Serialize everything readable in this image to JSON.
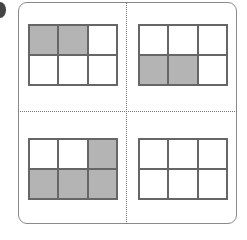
{
  "figure": {
    "shade_color": "#b4b4b4",
    "line_color": "#666666",
    "panels": [
      {
        "name": "top-left",
        "rows": 2,
        "cols": 3,
        "shaded": [
          [
            1,
            1,
            0
          ],
          [
            0,
            0,
            0
          ]
        ],
        "shaded_count": 2
      },
      {
        "name": "top-right",
        "rows": 2,
        "cols": 3,
        "shaded": [
          [
            0,
            0,
            0
          ],
          [
            1,
            1,
            0
          ]
        ],
        "shaded_count": 2
      },
      {
        "name": "bottom-left",
        "rows": 2,
        "cols": 3,
        "shaded": [
          [
            0,
            0,
            1
          ],
          [
            1,
            1,
            1
          ]
        ],
        "shaded_count": 4
      },
      {
        "name": "bottom-right",
        "rows": 2,
        "cols": 3,
        "shaded": [
          [
            0,
            0,
            0
          ],
          [
            0,
            0,
            0
          ]
        ],
        "shaded_count": 0
      }
    ]
  }
}
